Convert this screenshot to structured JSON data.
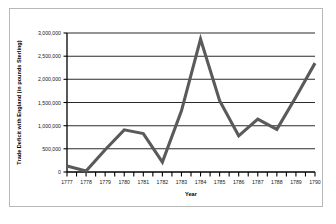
{
  "chart_data": {
    "type": "line",
    "title": "",
    "xlabel": "Year",
    "ylabel": "Trade Deficit with England (in pounds Sterling)",
    "categories": [
      1777,
      1778,
      1779,
      1780,
      1781,
      1782,
      1783,
      1784,
      1785,
      1786,
      1787,
      1788,
      1789,
      1790
    ],
    "x_tick_labels": [
      "1777",
      "1778",
      "1779",
      "1780",
      "1781",
      "1782",
      "1783",
      "1784",
      "1785",
      "1786",
      "1787",
      "1788",
      "1789",
      "1790"
    ],
    "values": [
      130000,
      20000,
      480000,
      910000,
      830000,
      215000,
      1320000,
      2870000,
      1540000,
      780000,
      1140000,
      920000,
      1620000,
      2350000
    ],
    "series": [
      {
        "name": "Trade Deficit with England",
        "values": [
          130000,
          20000,
          480000,
          910000,
          830000,
          215000,
          1320000,
          2870000,
          1540000,
          780000,
          1140000,
          920000,
          1620000,
          2350000
        ]
      }
    ],
    "ylim": [
      0,
      3000000
    ],
    "xlim": [
      1777,
      1790
    ],
    "y_ticks": [
      0,
      500000,
      1000000,
      1500000,
      2000000,
      2500000,
      3000000
    ],
    "y_tick_labels": [
      "0",
      "500,000",
      "1,000,000",
      "1,500,000",
      "2,000,000",
      "2,500,000",
      "3,000,000"
    ],
    "grid": "horizontal",
    "legend": "none",
    "line_color": "#5a5a5a",
    "grid_color": "#2b2b2b",
    "axis_color": "#000000",
    "plot_background": "#ffffff",
    "minor_ticks_per_interval": 2
  }
}
